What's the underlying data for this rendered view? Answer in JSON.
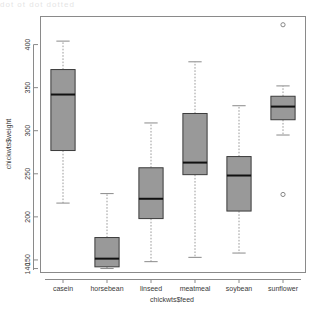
{
  "window": {
    "top_artifact_text": "dot ot dot dotted"
  },
  "chart_data": {
    "type": "box",
    "title": "",
    "xlabel": "chickwts$feed",
    "ylabel": "chickwts$weight",
    "grid": false,
    "legend": "none",
    "ylim": [
      136,
      432
    ],
    "ytick_values": [
      150,
      200,
      250,
      300,
      350,
      400
    ],
    "ytick_labels": [
      "150",
      "200",
      "250",
      "300",
      "350",
      "400"
    ],
    "ybottom_label": "140",
    "categories": [
      "casein",
      "horsebean",
      "linseed",
      "meatmeal",
      "soybean",
      "sunflower"
    ],
    "box_fill": "#999999",
    "box_stroke": "#3b3b3b",
    "median_color": "#111111",
    "whisker_color": "#9a9a9a",
    "outlier_color": "#888888",
    "boxes": [
      {
        "category": "casein",
        "min": 216,
        "q1": 277,
        "median": 342,
        "q3": 371,
        "max": 404,
        "outliers": []
      },
      {
        "category": "horsebean",
        "min": 140,
        "q1": 142,
        "median": 151.5,
        "q3": 176,
        "max": 227,
        "outliers": []
      },
      {
        "category": "linseed",
        "min": 148,
        "q1": 198,
        "median": 221,
        "q3": 257,
        "max": 309,
        "outliers": []
      },
      {
        "category": "meatmeal",
        "min": 153,
        "q1": 249,
        "median": 263,
        "q3": 320,
        "max": 380,
        "outliers": []
      },
      {
        "category": "soybean",
        "min": 158,
        "q1": 206.75,
        "median": 248,
        "q3": 270,
        "max": 329,
        "outliers": []
      },
      {
        "category": "sunflower",
        "min": 295,
        "q1": 312.75,
        "median": 328,
        "q3": 340,
        "max": 352,
        "outliers": [
          423,
          226
        ]
      }
    ]
  }
}
